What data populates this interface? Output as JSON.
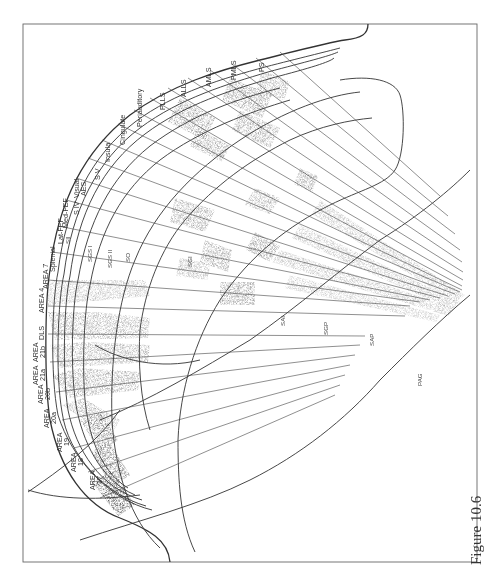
{
  "figure": {
    "caption": "Figure 10.6",
    "orientation": "rotated-90",
    "colors": {
      "line": "#333333",
      "frame": "#555555",
      "stipple_dark": "#444444",
      "stipple_light": "#9a9a9a",
      "background": "#ffffff"
    }
  },
  "cortical_areas": [
    {
      "id": "area17",
      "line1": "AREA",
      "line2": "17"
    },
    {
      "id": "area18",
      "line1": "AREA",
      "line2": "18"
    },
    {
      "id": "area19",
      "line1": "AREA",
      "line2": "19"
    },
    {
      "id": "area20a",
      "line1": "AREA",
      "line2": "20a"
    },
    {
      "id": "area20b",
      "line1": "AREA",
      "line2": "20b"
    },
    {
      "id": "area21a",
      "line1": "AREA",
      "line2": "21a"
    },
    {
      "id": "area21b",
      "line1": "AREA",
      "line2": "21b"
    },
    {
      "id": "dls",
      "line1": "DLS",
      "line2": ""
    },
    {
      "id": "area4",
      "line1": "AREA 4",
      "line2": ""
    },
    {
      "id": "area7",
      "line1": "AREA 7",
      "line2": ""
    },
    {
      "id": "splenial",
      "line1": "Splenial",
      "line2": ""
    },
    {
      "id": "latfef",
      "line1": "Lat-FEF",
      "line2": ""
    },
    {
      "id": "sii",
      "line1": "SII",
      "line2": ""
    },
    {
      "id": "medfef",
      "line1": "Med-FEF",
      "line2": ""
    },
    {
      "id": "siv",
      "line1": "S IV",
      "line2": ""
    },
    {
      "id": "visualaes",
      "line1": "Visual",
      "line2": "AES"
    },
    {
      "id": "sv",
      "line1": "S V",
      "line2": ""
    },
    {
      "id": "insula",
      "line1": "Insula",
      "line2": ""
    },
    {
      "id": "cingulate",
      "line1": "Cingulate",
      "line2": ""
    },
    {
      "id": "periauditory",
      "line1": "Periauditory",
      "line2": ""
    },
    {
      "id": "plls",
      "line1": "PLLS",
      "line2": ""
    },
    {
      "id": "alls",
      "line1": "ALLS",
      "line2": ""
    },
    {
      "id": "amls",
      "line1": "AMLS",
      "line2": ""
    },
    {
      "id": "pmls",
      "line1": "PMLS",
      "line2": ""
    },
    {
      "id": "ps",
      "line1": "PS",
      "line2": ""
    }
  ],
  "collicular_layers": {
    "sgs1": "SGS I",
    "sgs2": "SGS II",
    "so": "SO",
    "sgi": "SGI",
    "sai": "SAI",
    "sgp": "SGP",
    "sap": "SAP",
    "pag": "PAG"
  }
}
